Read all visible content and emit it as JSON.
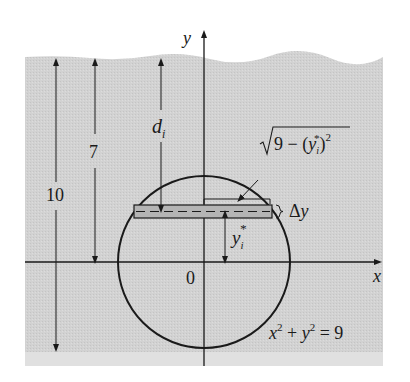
{
  "figure": {
    "axis_labels": {
      "x": "x",
      "y": "y"
    },
    "origin_label": "0",
    "circle_equation": {
      "x": "x",
      "exp1": "2",
      "plus": " + ",
      "y": "y",
      "exp2": "2",
      "eq": " = 9"
    },
    "dimensions": {
      "total_depth": "10",
      "center_depth": "7",
      "strip_depth": {
        "base": "d",
        "sub": "i"
      }
    },
    "strip": {
      "height_label": {
        "delta": "Δ",
        "var": "y"
      },
      "position_label": {
        "base": "y",
        "sub": "i",
        "sup": "*"
      },
      "half_width_label": {
        "root": "√",
        "radicand": "9 − (",
        "var": "y",
        "sub": "i",
        "sup": "*",
        "close": ")",
        "exp": "2"
      }
    },
    "colors": {
      "background_gray": "#d2d2d2",
      "bottom_band": "#e0e0e0",
      "strip_fill": "#b4b4b4",
      "line": "#1a1a1a"
    }
  }
}
